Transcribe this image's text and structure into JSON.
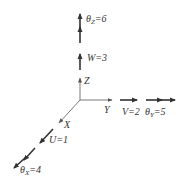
{
  "diagram": {
    "type": "coordinate-axes-dof",
    "colors": {
      "line": "#333333",
      "axis": "#555555",
      "background": "#ffffff"
    },
    "axes": [
      {
        "name": "X",
        "label": "X"
      },
      {
        "name": "Y",
        "label": "Y"
      },
      {
        "name": "Z",
        "label": "Z"
      }
    ],
    "translations": [
      {
        "symbol": "U",
        "value": "1",
        "axis": "X",
        "text": "U=1"
      },
      {
        "symbol": "V",
        "value": "2",
        "axis": "Y",
        "text": "V=2"
      },
      {
        "symbol": "W",
        "value": "3",
        "axis": "Z",
        "text": "W=3"
      }
    ],
    "rotations": [
      {
        "symbol": "θ",
        "subscript": "X",
        "value": "4",
        "axis": "X",
        "eq": "=4"
      },
      {
        "symbol": "θ",
        "subscript": "Y",
        "value": "5",
        "axis": "Y",
        "eq": "=5"
      },
      {
        "symbol": "θ",
        "subscript": "Z",
        "value": "6",
        "axis": "Z",
        "eq": "=6"
      }
    ]
  }
}
